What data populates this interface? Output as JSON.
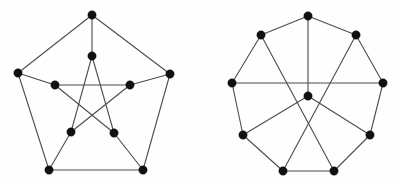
{
  "page": {
    "background_color": "#fefefe",
    "width": 398,
    "height": 187
  },
  "style": {
    "edge_color": "#4c4c4c",
    "vertex_color": "#111111",
    "edge_width": 1.1,
    "vertex_radius": 4.2,
    "vertex_radius_small": 3.8
  },
  "figures": [
    {
      "id": "petersen-graph",
      "name": "Petersen graph",
      "vertex_count": 10,
      "edge_count": 15,
      "vertices": [
        {
          "id": "o0",
          "label": "outer-top",
          "x": 92,
          "y": 15
        },
        {
          "id": "o1",
          "label": "outer-right",
          "x": 170,
          "y": 74
        },
        {
          "id": "o2",
          "label": "outer-bottom-right",
          "x": 143,
          "y": 170
        },
        {
          "id": "o3",
          "label": "outer-bottom-left",
          "x": 49,
          "y": 170
        },
        {
          "id": "o4",
          "label": "outer-left",
          "x": 18,
          "y": 73
        },
        {
          "id": "i0",
          "label": "inner-top",
          "x": 92,
          "y": 56
        },
        {
          "id": "i1",
          "label": "inner-right",
          "x": 130,
          "y": 85
        },
        {
          "id": "i2",
          "label": "inner-bottom-right",
          "x": 114,
          "y": 133
        },
        {
          "id": "i3",
          "label": "inner-bottom-left",
          "x": 71,
          "y": 132
        },
        {
          "id": "i4",
          "label": "inner-left",
          "x": 55,
          "y": 85
        }
      ],
      "edges": [
        {
          "from": "o0",
          "to": "o1",
          "kind": "outer-cycle"
        },
        {
          "from": "o1",
          "to": "o2",
          "kind": "outer-cycle"
        },
        {
          "from": "o2",
          "to": "o3",
          "kind": "outer-cycle"
        },
        {
          "from": "o3",
          "to": "o4",
          "kind": "outer-cycle"
        },
        {
          "from": "o4",
          "to": "o0",
          "kind": "outer-cycle"
        },
        {
          "from": "o0",
          "to": "i0",
          "kind": "spoke"
        },
        {
          "from": "o1",
          "to": "i1",
          "kind": "spoke"
        },
        {
          "from": "o2",
          "to": "i2",
          "kind": "spoke"
        },
        {
          "from": "o3",
          "to": "i3",
          "kind": "spoke"
        },
        {
          "from": "o4",
          "to": "i4",
          "kind": "spoke"
        },
        {
          "from": "i0",
          "to": "i2",
          "kind": "pentagram"
        },
        {
          "from": "i2",
          "to": "i4",
          "kind": "pentagram"
        },
        {
          "from": "i4",
          "to": "i1",
          "kind": "pentagram"
        },
        {
          "from": "i1",
          "to": "i3",
          "kind": "pentagram"
        },
        {
          "from": "i3",
          "to": "i0",
          "kind": "pentagram"
        }
      ]
    },
    {
      "id": "nine-cycle-hub-graph",
      "name": "Nine-cycle graph with central hub",
      "vertex_count": 10,
      "edge_count": 15,
      "vertices": [
        {
          "id": "r0",
          "label": "ring-top",
          "x": 308,
          "y": 16
        },
        {
          "id": "r1",
          "label": "ring-upper-right",
          "x": 356,
          "y": 35
        },
        {
          "id": "r2",
          "label": "ring-right",
          "x": 383,
          "y": 83
        },
        {
          "id": "r3",
          "label": "ring-lower-right",
          "x": 370,
          "y": 135
        },
        {
          "id": "r4",
          "label": "ring-bottom-right",
          "x": 334,
          "y": 171
        },
        {
          "id": "r5",
          "label": "ring-bottom-left",
          "x": 283,
          "y": 171
        },
        {
          "id": "r6",
          "label": "ring-lower-left",
          "x": 243,
          "y": 135
        },
        {
          "id": "r7",
          "label": "ring-left",
          "x": 232,
          "y": 83
        },
        {
          "id": "r8",
          "label": "ring-upper-left",
          "x": 261,
          "y": 35
        },
        {
          "id": "c0",
          "label": "center-hub",
          "x": 308,
          "y": 96
        }
      ],
      "edges": [
        {
          "from": "r0",
          "to": "r1",
          "kind": "outer-cycle"
        },
        {
          "from": "r1",
          "to": "r2",
          "kind": "outer-cycle"
        },
        {
          "from": "r2",
          "to": "r3",
          "kind": "outer-cycle"
        },
        {
          "from": "r3",
          "to": "r4",
          "kind": "outer-cycle"
        },
        {
          "from": "r4",
          "to": "r5",
          "kind": "outer-cycle"
        },
        {
          "from": "r5",
          "to": "r6",
          "kind": "outer-cycle"
        },
        {
          "from": "r6",
          "to": "r7",
          "kind": "outer-cycle"
        },
        {
          "from": "r7",
          "to": "r8",
          "kind": "outer-cycle"
        },
        {
          "from": "r8",
          "to": "r0",
          "kind": "outer-cycle"
        },
        {
          "from": "r7",
          "to": "r2",
          "kind": "chord"
        },
        {
          "from": "r8",
          "to": "r4",
          "kind": "chord"
        },
        {
          "from": "r1",
          "to": "r5",
          "kind": "chord"
        },
        {
          "from": "r0",
          "to": "c0",
          "kind": "spoke"
        },
        {
          "from": "r6",
          "to": "c0",
          "kind": "spoke"
        },
        {
          "from": "r3",
          "to": "c0",
          "kind": "spoke"
        }
      ]
    }
  ]
}
